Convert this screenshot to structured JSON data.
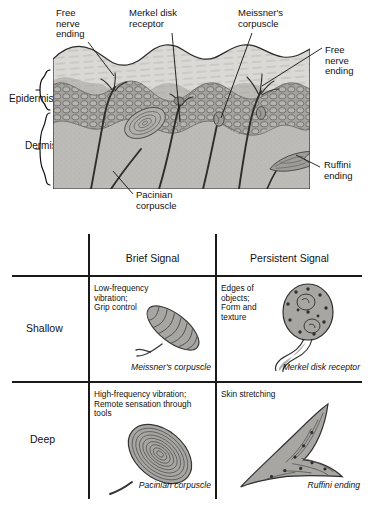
{
  "figure": {
    "top_diagram": {
      "name": "skin-cross-section",
      "labels": [
        {
          "id": "free-nerve-ending-left",
          "text": "Free\nnerve\nending"
        },
        {
          "id": "merkel-disk-receptor",
          "text": "Merkel disk\nreceptor"
        },
        {
          "id": "meissners-corpuscle",
          "text": "Meissner's\ncorpuscle"
        },
        {
          "id": "free-nerve-ending-right",
          "text": "Free\nnerve\nending"
        },
        {
          "id": "ruffini-ending",
          "text": "Ruffini\nending"
        },
        {
          "id": "pacinian-corpuscle",
          "text": "Pacinian\ncorpuscle"
        }
      ],
      "layers": [
        {
          "id": "epidermis",
          "text": "Epidermis"
        },
        {
          "id": "dermis",
          "text": "Dermis"
        }
      ]
    },
    "table": {
      "column_headers": [
        "",
        "Brief Signal",
        "Persistent Signal"
      ],
      "row_headers": [
        "Shallow",
        "Deep"
      ],
      "cells": [
        {
          "row": "Shallow",
          "column": "Brief Signal",
          "description": "Low-frequency\nvibration;\nGrip control",
          "caption": "Meissner's corpuscle",
          "receptor_icon": "meissners-corpuscle-icon"
        },
        {
          "row": "Shallow",
          "column": "Persistent Signal",
          "description": "Edges of\nobjects;\nForm and\ntexture",
          "caption": "Merkel disk receptor",
          "receptor_icon": "merkel-disk-receptor-icon"
        },
        {
          "row": "Deep",
          "column": "Brief Signal",
          "description": "High-frequency vibration;\nRemote sensation through\ntools",
          "caption": "Pacinian corpuscle",
          "receptor_icon": "pacinian-corpuscle-icon"
        },
        {
          "row": "Deep",
          "column": "Persistent Signal",
          "description": "Skin stretching",
          "caption": "Ruffini ending",
          "receptor_icon": "ruffini-ending-icon"
        }
      ]
    }
  },
  "colors": {
    "ink": "#1a1a1a",
    "stratum_corneum": "#d8d6d2",
    "epidermis_cells": "#9a9894",
    "dermis": "#bdbbb7",
    "receptor_fill": "#a8a6a2",
    "nerve": "#3a3a3a"
  }
}
